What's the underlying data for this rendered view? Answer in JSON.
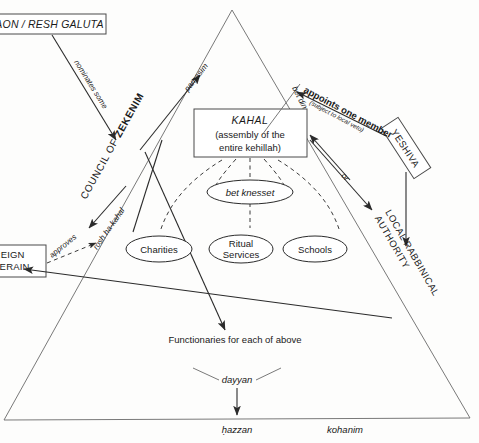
{
  "diagram": {
    "type": "organizational-diagram",
    "boxes": [
      {
        "id": "gaon",
        "label": "GAON / RESH GALUTA",
        "style": "italic-caps",
        "clipped": true
      },
      {
        "id": "kahal",
        "line1": "KAHAL",
        "line2": "(assembly of the",
        "line3": "entire kehillah)",
        "style": "italic-heading"
      },
      {
        "id": "yeshiva",
        "label": "YESHIVA",
        "style": "rotated-caps"
      },
      {
        "id": "foreign-suzerain",
        "line1": "FOREIGN",
        "line2": "SUZERAIN",
        "clipped": true
      }
    ],
    "ellipses": [
      {
        "id": "bet-knesset",
        "label": "bet knesset",
        "style": "italic"
      },
      {
        "id": "charities",
        "label": "Charities",
        "style": "roman"
      },
      {
        "id": "ritual-services",
        "line1": "Ritual",
        "line2": "Services",
        "style": "roman"
      },
      {
        "id": "schools",
        "label": "Schools",
        "style": "roman"
      }
    ],
    "side_labels": [
      {
        "id": "council-of-zekenim",
        "prefix": "COUNCIL OF ",
        "bold": "ZEKENIM"
      },
      {
        "id": "local-rabbinical-authority",
        "line1": "LOCAL RABBINICAL",
        "line2": "AUTHORITY"
      }
    ],
    "edge_labels": [
      {
        "id": "nominates-some",
        "text": "nominates some"
      },
      {
        "id": "parnasim",
        "text": "parnasim"
      },
      {
        "id": "bet-din",
        "text": "bet din"
      },
      {
        "id": "appoints-one-member",
        "text": "appoints one member"
      },
      {
        "id": "subject-to-local-veto",
        "text": "(subject to local veto)"
      },
      {
        "id": "or",
        "text": "or"
      },
      {
        "id": "approves",
        "text": "approves"
      },
      {
        "id": "rosh-ha-kahal",
        "text": "rosh ha-kahal"
      }
    ],
    "plain_labels": [
      {
        "id": "functionaries",
        "text": "Functionaries for each of above"
      },
      {
        "id": "dayyan",
        "text": "dayyan"
      },
      {
        "id": "hazzan",
        "text": "ḥazzan"
      },
      {
        "id": "kohanim",
        "text": "kohanim"
      }
    ],
    "colors": {
      "ink": "#1a1a1a",
      "line": "#4b4b4b",
      "thin_line": "#6a6a6a",
      "paper": "#fdfdfc"
    }
  }
}
